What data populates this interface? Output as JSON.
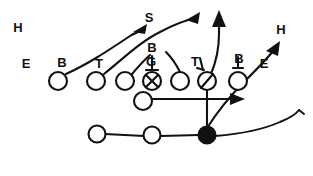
{
  "diagram": {
    "type": "american-football-play",
    "ink_color": "#111111",
    "background_color": "#ffffff",
    "width": 313,
    "height": 176,
    "labels": [
      {
        "id": "h-left",
        "text": "H",
        "x": 18,
        "y": 29
      },
      {
        "id": "e-left",
        "text": "E",
        "x": 26,
        "y": 65
      },
      {
        "id": "b-left",
        "text": "B",
        "x": 62,
        "y": 64
      },
      {
        "id": "t-left",
        "text": "T",
        "x": 99,
        "y": 65
      },
      {
        "id": "s-top",
        "text": "S",
        "x": 149,
        "y": 19
      },
      {
        "id": "b-center",
        "text": "B",
        "x": 152,
        "y": 49
      },
      {
        "id": "g-center",
        "text": "G",
        "x": 151,
        "y": 63
      },
      {
        "id": "t-right",
        "text": "T",
        "x": 195,
        "y": 63
      },
      {
        "id": "b-right",
        "text": "B",
        "x": 239,
        "y": 60
      },
      {
        "id": "e-right",
        "text": "E",
        "x": 264,
        "y": 65
      },
      {
        "id": "h-right",
        "text": "H",
        "x": 281,
        "y": 31
      }
    ],
    "players": [
      {
        "id": "lineman-1",
        "label_ref": "b-left",
        "x": 58,
        "y": 81,
        "r": 9,
        "fill": "open"
      },
      {
        "id": "lineman-2",
        "label_ref": "t-left",
        "x": 96,
        "y": 81,
        "r": 9,
        "fill": "open"
      },
      {
        "id": "lineman-3",
        "label_ref": "",
        "x": 125,
        "y": 81,
        "r": 9,
        "fill": "open"
      },
      {
        "id": "center",
        "label_ref": "g-center",
        "x": 152,
        "y": 81,
        "r": 9,
        "fill": "open-x"
      },
      {
        "id": "lineman-5",
        "label_ref": "",
        "x": 180,
        "y": 81,
        "r": 9,
        "fill": "open"
      },
      {
        "id": "lineman-6",
        "label_ref": "t-right",
        "x": 207,
        "y": 81,
        "r": 9,
        "fill": "open-slash"
      },
      {
        "id": "lineman-7",
        "label_ref": "b-right",
        "x": 238,
        "y": 81,
        "r": 9,
        "fill": "open"
      },
      {
        "id": "quarterback",
        "label_ref": "",
        "x": 143,
        "y": 101,
        "r": 9,
        "fill": "open"
      },
      {
        "id": "back-left",
        "label_ref": "",
        "x": 97,
        "y": 134,
        "r": 8.5,
        "fill": "open"
      },
      {
        "id": "back-mid",
        "label_ref": "",
        "x": 152,
        "y": 135,
        "r": 8.5,
        "fill": "open"
      },
      {
        "id": "ball-carrier",
        "label_ref": "",
        "x": 207,
        "y": 135,
        "r": 8.5,
        "fill": "solid"
      }
    ],
    "routes": [
      {
        "id": "route-b-left-deep",
        "arrow": true
      },
      {
        "id": "route-t-left-deep",
        "arrow": true
      },
      {
        "id": "route-lineman3-up",
        "arrow": false
      },
      {
        "id": "route-lineman5-up",
        "arrow": false
      },
      {
        "id": "route-t-right-vert",
        "arrow": true
      },
      {
        "id": "route-qb-handoff",
        "arrow": true
      },
      {
        "id": "route-carrier-sweep",
        "arrow": true
      },
      {
        "id": "route-bottom-flat",
        "arrow": true
      },
      {
        "id": "route-block-vertical",
        "arrow": false
      },
      {
        "id": "route-backfield-line",
        "arrow": false
      }
    ]
  }
}
